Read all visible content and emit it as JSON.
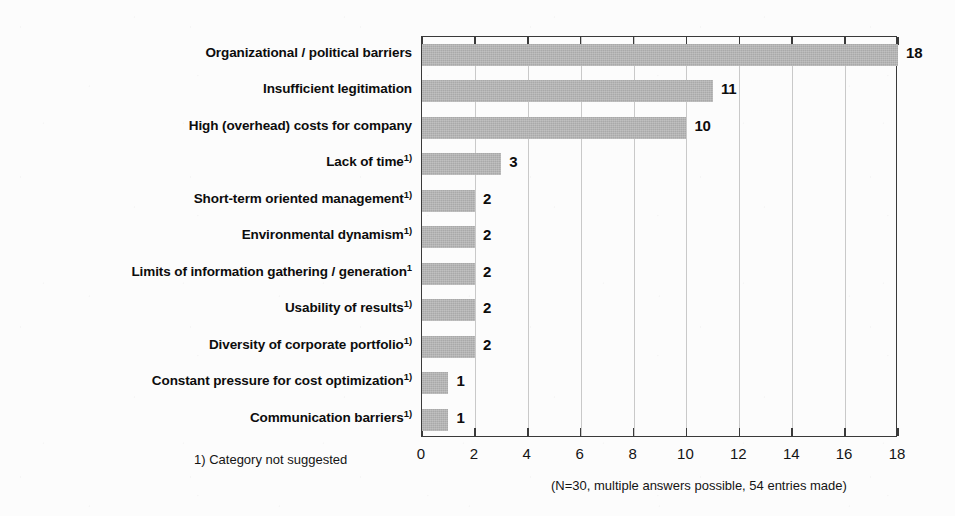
{
  "chart_data": {
    "type": "bar",
    "orientation": "horizontal",
    "title": "",
    "xlabel": "",
    "ylabel": "",
    "xlim": [
      0,
      18
    ],
    "xticks": [
      0,
      2,
      4,
      6,
      8,
      10,
      12,
      14,
      16,
      18
    ],
    "grid": true,
    "grid_axis": "x",
    "legend": false,
    "categories": [
      "Organizational / political barriers",
      "Insufficient legitimation",
      "High (overhead) costs for company",
      "Lack of time",
      "Short-term oriented management",
      "Environmental dynamism",
      "Limits of information gathering / generation",
      "Usability of results",
      "Diversity of corporate portfolio",
      "Constant pressure for cost optimization",
      "Communication barriers"
    ],
    "category_superscripts": [
      "",
      "",
      "",
      "1)",
      "1)",
      "1)",
      "1",
      "1)",
      "1)",
      "1)",
      "1)"
    ],
    "values": [
      18,
      11,
      10,
      3,
      2,
      2,
      2,
      2,
      2,
      1,
      1
    ],
    "value_labels": [
      "18",
      "11",
      "10",
      "3",
      "2",
      "2",
      "2",
      "2",
      "2",
      "1",
      "1"
    ],
    "bar_color": "#a9a9a9",
    "axis_color": "#3a3a3a",
    "gridline_color": "#c9c9c9"
  },
  "footnote": "1) Category not suggested",
  "note": "(N=30, multiple answers possible, 54 entries made)"
}
